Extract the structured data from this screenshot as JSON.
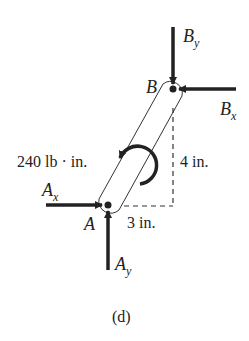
{
  "figure": {
    "caption": "(d)",
    "points": {
      "A": {
        "label": "A"
      },
      "B": {
        "label": "B"
      }
    },
    "forces": {
      "By": {
        "base": "B",
        "sub": "y",
        "direction": "down"
      },
      "Bx": {
        "base": "B",
        "sub": "x",
        "direction": "left"
      },
      "Ax": {
        "base": "A",
        "sub": "x",
        "direction": "right"
      },
      "Ay": {
        "base": "A",
        "sub": "y",
        "direction": "up"
      }
    },
    "moment": {
      "label": "240 lb · in.",
      "direction": "counterclockwise"
    },
    "dimensions": {
      "vertical": "4 in.",
      "horizontal": "3 in."
    },
    "colors": {
      "ink": "#222222",
      "background": "#ffffff"
    }
  }
}
